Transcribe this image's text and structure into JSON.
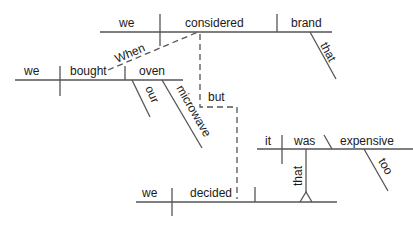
{
  "diagram": {
    "type": "sentence-diagram",
    "clause_when": {
      "subject": "we",
      "verb": "considered",
      "object": "brand",
      "object_modifier": "that",
      "connector": "When"
    },
    "clause_bought": {
      "subject": "we",
      "verb": "bought",
      "object": "oven",
      "modifiers": [
        "our",
        "microwave"
      ]
    },
    "conjunction": "but",
    "main_clause": {
      "subject": "we",
      "verb": "decided",
      "noun_clause_connector": "that"
    },
    "noun_clause": {
      "subject": "it",
      "verb": "was",
      "complement": "expensive",
      "complement_modifier": "too"
    }
  }
}
